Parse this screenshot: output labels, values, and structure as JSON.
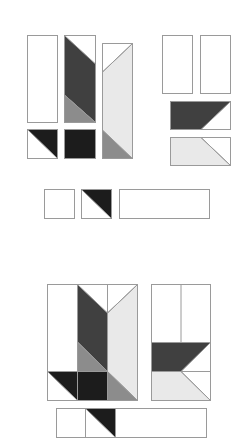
{
  "diagram": {
    "type": "quilt-block-assembly",
    "colors": {
      "white": "#ffffff",
      "light": "#e9e9e9",
      "medium": "#8c8c8c",
      "dark": "#404040",
      "black": "#1c1c1c",
      "stroke": "#9a9a9a"
    },
    "stages": [
      {
        "id": "unit-pieces",
        "label": "Unit pieces (exploded)"
      },
      {
        "id": "assembled-block",
        "label": "Assembled block"
      }
    ]
  }
}
